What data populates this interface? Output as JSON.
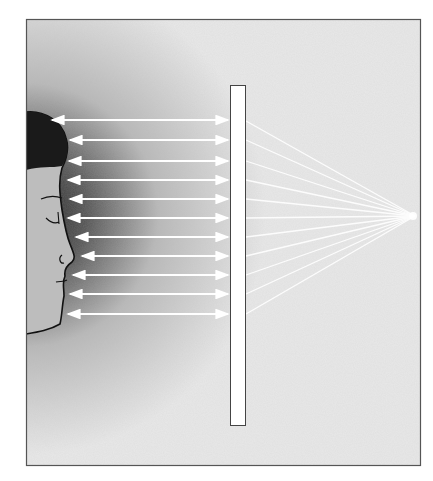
{
  "figure": {
    "colors": {
      "background_light": "#e6e6e6",
      "background_dark": "#3a3a3a",
      "hair": "#1a1a1a",
      "skin": "#bdbdbd",
      "ray": "#ffffff",
      "frame": "#555555",
      "plate": "#ffffff"
    },
    "frame": {
      "x": 26,
      "y": 19,
      "width": 395,
      "height": 447
    },
    "plate": {
      "x": 230,
      "y": 85,
      "width": 16,
      "height": 341
    },
    "focal_point": {
      "x": 415,
      "y": 216
    },
    "arrow_rays_y": [
      120,
      140,
      161,
      180,
      199,
      218,
      237,
      256,
      275,
      294,
      314
    ],
    "arrow_rays_x_start": [
      50,
      68,
      67,
      66,
      68,
      66,
      74,
      80,
      71,
      68,
      66
    ]
  }
}
